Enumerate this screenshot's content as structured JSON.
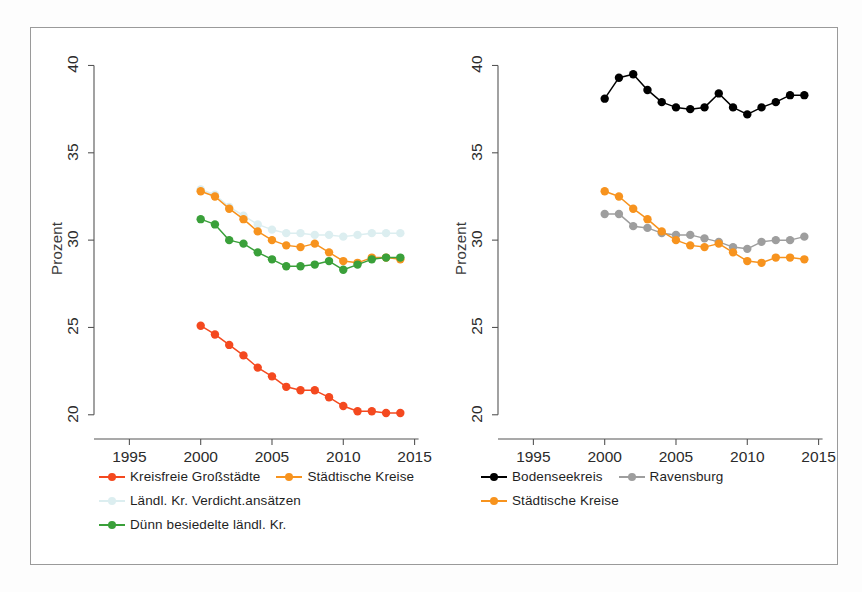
{
  "figure": {
    "background_color": "#ffffff",
    "frame_color": "#9a9a9a"
  },
  "colors": {
    "kreisfreie_grossstaedte": "#F4491F",
    "staedtische_kreise": "#F7931E",
    "laendl_kr_verdicht": "#DCEEF0",
    "duenn_besiedelte": "#3AA03A",
    "bodenseekreis": "#000000",
    "ravensburg": "#9E9E9E",
    "axis": "#555555",
    "text": "#1f1f1f"
  },
  "panels": [
    {
      "id": "left",
      "ylabel": "Prozent",
      "xlabel": "",
      "yticks": [
        "20",
        "25",
        "30",
        "35",
        "40"
      ],
      "xticks": [
        "1995",
        "2000",
        "2005",
        "2010",
        "2015"
      ],
      "legend": [
        {
          "label": "Kreisfreie Großstädte",
          "color_key": "kreisfreie_grossstaedte",
          "row": 0,
          "col": 0
        },
        {
          "label": "Städtische Kreise",
          "color_key": "staedtische_kreise",
          "row": 0,
          "col": 1
        },
        {
          "label": "Ländl. Kr. Verdicht.ansätzen",
          "color_key": "laendl_kr_verdicht",
          "row": 1,
          "col": 0
        },
        {
          "label": "Dünn besiedelte ländl. Kr.",
          "color_key": "duenn_besiedelte",
          "row": 2,
          "col": 0
        }
      ]
    },
    {
      "id": "right",
      "ylabel": "Prozent",
      "xlabel": "",
      "yticks": [
        "20",
        "25",
        "30",
        "35",
        "40"
      ],
      "xticks": [
        "1995",
        "2000",
        "2005",
        "2010",
        "2015"
      ],
      "legend": [
        {
          "label": "Bodenseekreis",
          "color_key": "bodenseekreis",
          "row": 0,
          "col": 0
        },
        {
          "label": "Ravensburg",
          "color_key": "ravensburg",
          "row": 0,
          "col": 1
        },
        {
          "label": "Städtische Kreise",
          "color_key": "staedtische_kreise",
          "row": 1,
          "col": 0
        }
      ]
    }
  ],
  "chart_data": [
    {
      "type": "line",
      "panel": "left",
      "title": "",
      "xlabel": "",
      "ylabel": "Prozent",
      "xlim": [
        1993.5,
        2015.8
      ],
      "ylim": [
        19.3,
        40.6
      ],
      "xticks": [
        1995,
        2000,
        2005,
        2010,
        2015
      ],
      "yticks": [
        20,
        25,
        30,
        35,
        40
      ],
      "grid": false,
      "legend_position": "below",
      "x": [
        2000,
        2001,
        2002,
        2003,
        2004,
        2005,
        2006,
        2007,
        2008,
        2009,
        2010,
        2011,
        2012,
        2013,
        2014
      ],
      "series": [
        {
          "name": "Kreisfreie Großstädte",
          "color": "#F4491F",
          "values": [
            25.1,
            24.6,
            24.0,
            23.4,
            22.7,
            22.2,
            21.6,
            21.4,
            21.4,
            21.0,
            20.5,
            20.2,
            20.2,
            20.1,
            20.1
          ]
        },
        {
          "name": "Städtische Kreise",
          "color": "#F7931E",
          "values": [
            32.8,
            32.5,
            31.8,
            31.2,
            30.5,
            30.0,
            29.7,
            29.6,
            29.8,
            29.3,
            28.8,
            28.7,
            29.0,
            29.0,
            28.9
          ]
        },
        {
          "name": "Ländl. Kr. Verdicht.ansätzen",
          "color": "#DCEEF0",
          "values": [
            32.9,
            32.6,
            31.9,
            31.4,
            30.9,
            30.6,
            30.4,
            30.4,
            30.3,
            30.3,
            30.2,
            30.3,
            30.4,
            30.4,
            30.4
          ]
        },
        {
          "name": "Dünn besiedelte ländl. Kr.",
          "color": "#3AA03A",
          "values": [
            31.2,
            30.9,
            30.0,
            29.8,
            29.3,
            28.9,
            28.5,
            28.5,
            28.6,
            28.8,
            28.3,
            28.6,
            28.9,
            29.0,
            29.0
          ]
        }
      ]
    },
    {
      "type": "line",
      "panel": "right",
      "title": "",
      "xlabel": "",
      "ylabel": "Prozent",
      "xlim": [
        1993.5,
        2015.8
      ],
      "ylim": [
        19.3,
        40.6
      ],
      "xticks": [
        1995,
        2000,
        2005,
        2010,
        2015
      ],
      "yticks": [
        20,
        25,
        30,
        35,
        40
      ],
      "grid": false,
      "legend_position": "below",
      "x": [
        2000,
        2001,
        2002,
        2003,
        2004,
        2005,
        2006,
        2007,
        2008,
        2009,
        2010,
        2011,
        2012,
        2013,
        2014
      ],
      "series": [
        {
          "name": "Bodenseekreis",
          "color": "#000000",
          "values": [
            38.1,
            39.3,
            39.5,
            38.6,
            37.9,
            37.6,
            37.5,
            37.6,
            38.4,
            37.6,
            37.2,
            37.6,
            37.9,
            38.3,
            38.3
          ]
        },
        {
          "name": "Ravensburg",
          "color": "#9E9E9E",
          "values": [
            31.5,
            31.5,
            30.8,
            30.7,
            30.4,
            30.3,
            30.3,
            30.1,
            29.9,
            29.6,
            29.5,
            29.9,
            30.0,
            30.0,
            30.2
          ]
        },
        {
          "name": "Städtische Kreise",
          "color": "#F7931E",
          "values": [
            32.8,
            32.5,
            31.8,
            31.2,
            30.5,
            30.0,
            29.7,
            29.6,
            29.8,
            29.3,
            28.8,
            28.7,
            29.0,
            29.0,
            28.9
          ]
        }
      ]
    }
  ]
}
